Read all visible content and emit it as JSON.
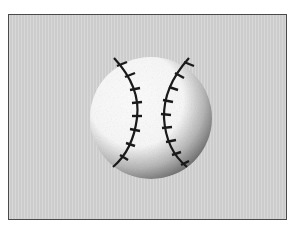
{
  "top_text": "……………………………… ……………",
  "illustration": {
    "subject": "baseball",
    "icon": "baseball-icon",
    "colors": {
      "frame_border": "#4a4a4a",
      "frame_fill": "#d3d3d3",
      "ball": "#ffffff",
      "stitches": "#1a1a1a"
    }
  }
}
